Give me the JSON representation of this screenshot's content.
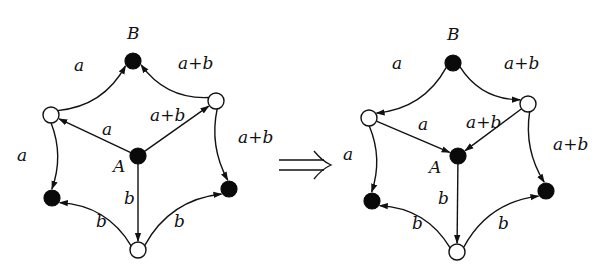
{
  "figure": {
    "arrow_symbol": "⟹",
    "graphs": [
      {
        "id": "before",
        "nodes": [
          {
            "id": "B",
            "label": "B",
            "kind": "filled"
          },
          {
            "id": "UL",
            "label": "",
            "kind": "open"
          },
          {
            "id": "UR",
            "label": "",
            "kind": "open"
          },
          {
            "id": "A",
            "label": "A",
            "kind": "filled"
          },
          {
            "id": "LL",
            "label": "",
            "kind": "filled"
          },
          {
            "id": "LR",
            "label": "",
            "kind": "filled"
          },
          {
            "id": "BOT",
            "label": "",
            "kind": "open"
          }
        ],
        "edges": [
          {
            "from": "UL",
            "to": "B",
            "label": "a",
            "curved": true
          },
          {
            "from": "UR",
            "to": "B",
            "label": "a+b",
            "curved": true
          },
          {
            "from": "A",
            "to": "UL",
            "label": "a",
            "curved": false
          },
          {
            "from": "A",
            "to": "UR",
            "label": "a+b",
            "curved": false
          },
          {
            "from": "UL",
            "to": "LL",
            "label": "a",
            "curved": true
          },
          {
            "from": "UR",
            "to": "LR",
            "label": "a+b",
            "curved": true
          },
          {
            "from": "A",
            "to": "BOT",
            "label": "b",
            "curved": false
          },
          {
            "from": "BOT",
            "to": "LL",
            "label": "b",
            "curved": true
          },
          {
            "from": "BOT",
            "to": "LR",
            "label": "b",
            "curved": true
          }
        ]
      },
      {
        "id": "after",
        "nodes": [
          {
            "id": "B",
            "label": "B",
            "kind": "filled"
          },
          {
            "id": "UL",
            "label": "",
            "kind": "open"
          },
          {
            "id": "UR",
            "label": "",
            "kind": "open"
          },
          {
            "id": "A",
            "label": "A",
            "kind": "filled"
          },
          {
            "id": "LL",
            "label": "",
            "kind": "filled"
          },
          {
            "id": "LR",
            "label": "",
            "kind": "filled"
          },
          {
            "id": "BOT",
            "label": "",
            "kind": "open"
          }
        ],
        "edges": [
          {
            "from": "B",
            "to": "UL",
            "label": "a",
            "curved": true
          },
          {
            "from": "B",
            "to": "UR",
            "label": "a+b",
            "curved": true
          },
          {
            "from": "UL",
            "to": "A",
            "label": "a",
            "curved": false
          },
          {
            "from": "UR",
            "to": "A",
            "label": "a+b",
            "curved": false
          },
          {
            "from": "UL",
            "to": "LL",
            "label": "a",
            "curved": true
          },
          {
            "from": "UR",
            "to": "LR",
            "label": "a+b",
            "curved": true
          },
          {
            "from": "A",
            "to": "BOT",
            "label": "b",
            "curved": false
          },
          {
            "from": "BOT",
            "to": "LL",
            "label": "b",
            "curved": true
          },
          {
            "from": "BOT",
            "to": "LR",
            "label": "b",
            "curved": true
          }
        ]
      }
    ]
  }
}
